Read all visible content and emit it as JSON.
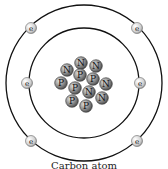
{
  "diagram": {
    "title": "Carbon atom",
    "caption": "Carbon atom",
    "orbits": [
      {
        "name": "inner-shell",
        "cx": 84,
        "cy": 83,
        "r": 55
      },
      {
        "name": "outer-shell",
        "cx": 84,
        "cy": 83,
        "r": 78
      }
    ],
    "electron_label": "e",
    "electrons": [
      {
        "x": 31,
        "y": 28
      },
      {
        "x": 137,
        "y": 28
      },
      {
        "x": 27,
        "y": 83
      },
      {
        "x": 140,
        "y": 83
      },
      {
        "x": 31,
        "y": 141
      },
      {
        "x": 137,
        "y": 141
      }
    ],
    "nucleons": [
      {
        "label": "N",
        "x": 81,
        "y": 63
      },
      {
        "label": "N",
        "x": 67,
        "y": 70
      },
      {
        "label": "N",
        "x": 96,
        "y": 66
      },
      {
        "label": "P",
        "x": 80,
        "y": 75
      },
      {
        "label": "P",
        "x": 93,
        "y": 79
      },
      {
        "label": "N",
        "x": 106,
        "y": 84
      },
      {
        "label": "P",
        "x": 61,
        "y": 83
      },
      {
        "label": "P",
        "x": 75,
        "y": 88
      },
      {
        "label": "N",
        "x": 89,
        "y": 92
      },
      {
        "label": "N",
        "x": 102,
        "y": 98
      },
      {
        "label": "P",
        "x": 72,
        "y": 101
      },
      {
        "label": "P",
        "x": 86,
        "y": 106
      }
    ],
    "colors": {
      "orbit": "#111111",
      "electron_fill": "#d9d9d9",
      "nucleon_fill": "#8a8a8a",
      "text": "#111111"
    }
  }
}
